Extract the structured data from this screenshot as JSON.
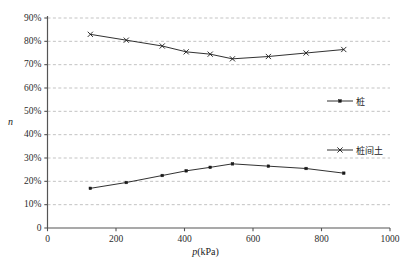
{
  "chart_data": {
    "type": "line",
    "title": "",
    "xlabel": "p(kPa)",
    "xlabel_italic_part": "p",
    "xlabel_rest": "(kPa)",
    "ylabel": "n",
    "xlim": [
      0,
      1000
    ],
    "ylim": [
      0,
      0.9
    ],
    "grid": true,
    "grid_style": "dashed-horizontal",
    "legend_position": "inside-right",
    "x_ticks": [
      0,
      200,
      400,
      600,
      800,
      1000
    ],
    "x_tick_labels": [
      "0",
      "200",
      "400",
      "600",
      "800",
      "1000"
    ],
    "y_ticks": [
      0,
      0.1,
      0.2,
      0.3,
      0.4,
      0.5,
      0.6,
      0.7,
      0.8,
      0.9
    ],
    "y_tick_labels": [
      "0",
      "10%",
      "20%",
      "30%",
      "40%",
      "50%",
      "60%",
      "70%",
      "80%",
      "90%"
    ],
    "x": [
      125,
      230,
      335,
      405,
      475,
      540,
      645,
      755,
      865
    ],
    "series": [
      {
        "name": "桩",
        "marker": "square",
        "color": "#1a1a1a",
        "values": [
          0.17,
          0.195,
          0.225,
          0.245,
          0.26,
          0.275,
          0.265,
          0.255,
          0.235
        ]
      },
      {
        "name": "桩间土",
        "marker": "cross",
        "color": "#1a1a1a",
        "values": [
          0.83,
          0.805,
          0.78,
          0.755,
          0.745,
          0.725,
          0.735,
          0.75,
          0.765
        ]
      }
    ]
  },
  "legend": {
    "items": [
      {
        "label": "桩",
        "marker": "square"
      },
      {
        "label": "桩间土",
        "marker": "cross"
      }
    ]
  },
  "colors": {
    "axis": "#555555",
    "grid": "#9a9a9a",
    "line": "#1a1a1a",
    "text": "#1a1a1a",
    "background": "#ffffff"
  }
}
